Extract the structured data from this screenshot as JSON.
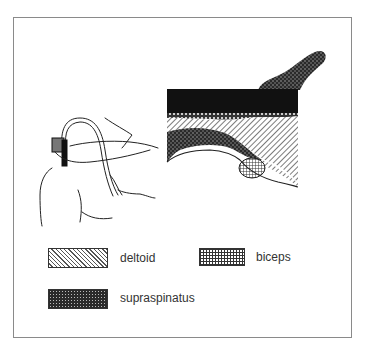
{
  "figure": {
    "legend": [
      {
        "key": "deltoid",
        "label": "deltoid",
        "pattern": "diagonal-hatch"
      },
      {
        "key": "biceps",
        "label": "biceps",
        "pattern": "grid"
      },
      {
        "key": "supraspinatus",
        "label": "supraspinatus",
        "pattern": "dark-stipple"
      }
    ]
  },
  "colors": {
    "border": "#8a8a8a",
    "ink": "#222222",
    "text": "#333333",
    "background": "#ffffff"
  }
}
